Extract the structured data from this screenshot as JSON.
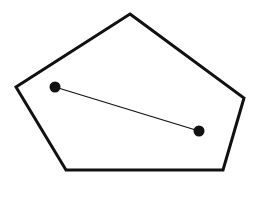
{
  "diagram": {
    "shape": "pentagon",
    "vertex_count": 5,
    "interior_points": 2,
    "segments": 1,
    "colors": {
      "stroke": "#111111",
      "fill": "#ffffff",
      "point": "#111111"
    }
  }
}
